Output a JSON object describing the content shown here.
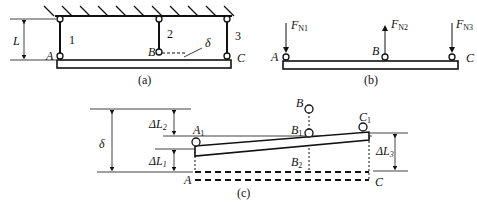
{
  "figure": {
    "panels": {
      "a": {
        "caption": "(a)",
        "labels": {
          "length": "L",
          "point_a": "A",
          "point_b": "B",
          "point_c": "C",
          "rod1": "1",
          "rod2": "2",
          "rod3": "3",
          "gap": "δ"
        }
      },
      "b": {
        "caption": "(b)",
        "labels": {
          "point_a": "A",
          "point_b": "B",
          "point_c": "C",
          "f1": "F",
          "f1_sub": "N1",
          "f2": "F",
          "f2_sub": "N2",
          "f3": "F",
          "f3_sub": "N3"
        }
      },
      "c": {
        "caption": "(c)",
        "labels": {
          "delta": "δ",
          "dl1": "ΔL",
          "dl1_sub": "1",
          "dl2": "ΔL",
          "dl2_sub": "2",
          "dl3": "ΔL",
          "dl3_sub": "3",
          "a1": "A",
          "a1_sub": "1",
          "b": "B",
          "b1": "B",
          "b1_sub": "1",
          "b2": "B",
          "b2_sub": "2",
          "c1": "C",
          "c1_sub": "1",
          "a": "A",
          "c": "C"
        }
      }
    }
  }
}
